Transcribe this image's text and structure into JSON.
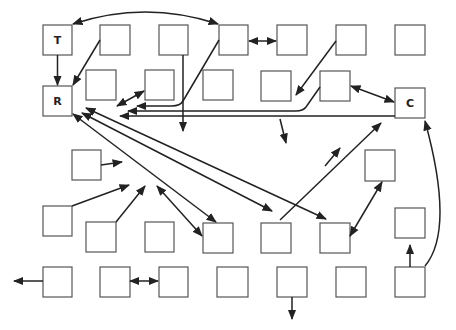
{
  "diagram": {
    "colors": {
      "box_stroke": "#555555",
      "edge": "#222222",
      "background": "#ffffff"
    },
    "labeled_nodes": [
      {
        "id": "T",
        "label": "T"
      },
      {
        "id": "R",
        "label": "R"
      },
      {
        "id": "C",
        "label": "C"
      }
    ],
    "node_count": 31,
    "edge_count": 30
  }
}
